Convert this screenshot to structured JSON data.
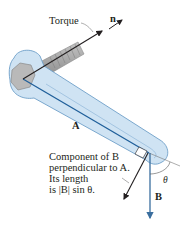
{
  "labels": {
    "torque": "Torque",
    "n": "n",
    "A": "A",
    "B": "B",
    "theta": "θ",
    "component_line1": "Component of B",
    "component_line2": "perpendicular to A.",
    "component_line3": "Its length",
    "component_line4": "is |B| sin θ."
  },
  "colors": {
    "wrench_fill": "#cfe3f3",
    "wrench_stroke": "#6e9fc8",
    "bolt_fill": "#a8a8a8",
    "vector_A": "#1f5f9a",
    "vector_B": "#3a6e9e",
    "vector_dark": "#231f20"
  }
}
